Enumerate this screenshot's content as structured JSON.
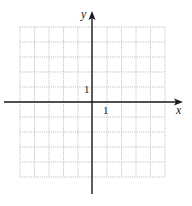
{
  "chart_data": {
    "type": "grid",
    "title": "",
    "xlabel": "x",
    "ylabel": "y",
    "xlim": [
      -5,
      5
    ],
    "ylim": [
      -5,
      5
    ],
    "grid": true,
    "tick_labels": {
      "x": "1",
      "y": "1"
    },
    "x_unit_tick": 1,
    "y_unit_tick": 1
  },
  "axes": {
    "x_label": "x",
    "y_label": "y",
    "x_tick_label": "1",
    "y_tick_label": "1"
  },
  "colors": {
    "grid": "#b8b8b8",
    "axis": "#1a1a1a"
  }
}
